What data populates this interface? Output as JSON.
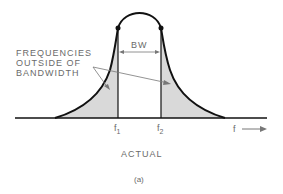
{
  "diagram": {
    "annotation": {
      "lines": [
        "FREQUENCIES",
        "OUTSIDE OF",
        "BANDWIDTH"
      ]
    },
    "bandwidth_label": "BW",
    "f1_label": "f",
    "f1_sub": "1",
    "f2_label": "f",
    "f2_sub": "2",
    "axis_label": "f",
    "caption": "ACTUAL",
    "subfigure": "(a)",
    "colors": {
      "curve": "#111111",
      "shade": "#d9d9d9",
      "text": "#6a6a6a",
      "arrow": "#777777"
    }
  }
}
